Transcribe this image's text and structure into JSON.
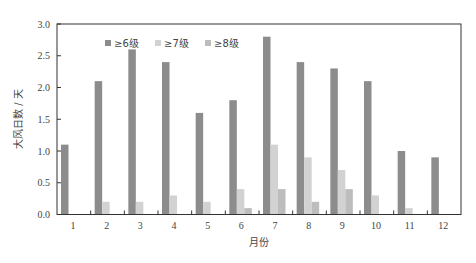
{
  "chart_data": {
    "type": "bar",
    "title": "",
    "xlabel": "月份",
    "ylabel": "大风日数 / 天",
    "ylim": [
      0,
      3.0
    ],
    "yticks": [
      "0.0",
      "0.5",
      "1.0",
      "1.5",
      "2.0",
      "2.5",
      "3.0"
    ],
    "categories": [
      "1",
      "2",
      "3",
      "4",
      "5",
      "6",
      "7",
      "8",
      "9",
      "10",
      "11",
      "12"
    ],
    "series": [
      {
        "name": "≥6级",
        "color": "#8c8c8c",
        "values": [
          1.1,
          2.1,
          2.6,
          2.4,
          1.6,
          1.8,
          2.8,
          2.4,
          2.3,
          2.1,
          1.0,
          0.9
        ]
      },
      {
        "name": "≥7级",
        "color": "#d2d2d2",
        "values": [
          0.0,
          0.2,
          0.2,
          0.3,
          0.2,
          0.4,
          1.1,
          0.9,
          0.7,
          0.3,
          0.1,
          0.0
        ]
      },
      {
        "name": "≥8级",
        "color": "#bdbdbd",
        "values": [
          0.0,
          0.0,
          0.0,
          0.0,
          0.0,
          0.1,
          0.4,
          0.2,
          0.4,
          0.0,
          0.0,
          0.0
        ]
      }
    ],
    "legend_position": "top-left-inside",
    "grid": false
  }
}
